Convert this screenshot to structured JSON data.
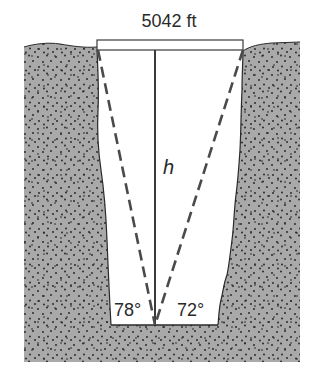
{
  "diagram": {
    "type": "trigonometry-figure",
    "top_width": {
      "value": 5042,
      "unit": "ft",
      "label": "5042 ft"
    },
    "height": {
      "symbol": "h",
      "label": "h"
    },
    "angles": {
      "left": {
        "value": 78,
        "label": "78°"
      },
      "right": {
        "value": 72,
        "label": "72°"
      }
    },
    "colors": {
      "ground_fill": "#a9a9a9",
      "ground_dots": "#1e1e1e",
      "shaft_fill": "#ffffff",
      "line": "#3a3a3a",
      "dashed_line": "#4a4a4a",
      "text": "#2a2a2a"
    }
  }
}
